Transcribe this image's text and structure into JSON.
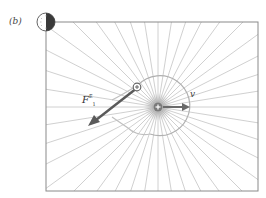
{
  "figure": {
    "panel_label": "(b)",
    "force_label": {
      "symbol": "F",
      "superscript": "E",
      "subscript": "1"
    },
    "velocity_label": "v",
    "colors": {
      "field_lines": "#bdbdbd",
      "frame": "#8a8a8a",
      "arrow": "#5a5a5a",
      "charge": "#6a6a6a",
      "clock_dark": "#3a3a3a"
    },
    "charges": [
      {
        "sign": "+",
        "role": "moving-source-charge",
        "x": 158,
        "y": 107
      },
      {
        "sign": "+",
        "role": "test-charge",
        "x": 137,
        "y": 87
      }
    ],
    "field_line_count": 40
  }
}
